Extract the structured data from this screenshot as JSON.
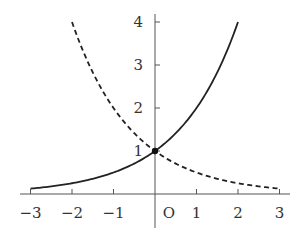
{
  "chart_data": {
    "type": "line",
    "title": "",
    "xlabel": "",
    "ylabel": "",
    "origin_label": "O",
    "x_ticks": [
      -3,
      -2,
      -1,
      1,
      2,
      3
    ],
    "x_tick_labels": [
      "−3",
      "−2",
      "−1",
      "1",
      "2",
      "3"
    ],
    "y_ticks": [
      1,
      2,
      3,
      4
    ],
    "y_tick_labels": [
      "1",
      "2",
      "3",
      "4"
    ],
    "xlim": [
      -3.3,
      3.3
    ],
    "ylim": [
      -0.5,
      4.2
    ],
    "grid": false,
    "legend": null,
    "series": [
      {
        "name": "y = 2^x",
        "style": "solid",
        "x": [
          -3,
          -2,
          -1,
          0,
          1,
          2
        ],
        "y": [
          0.125,
          0.25,
          0.5,
          1,
          2,
          4
        ]
      },
      {
        "name": "y = (1/2)^x",
        "style": "dashed",
        "x": [
          -2,
          -1,
          0,
          1,
          2,
          3
        ],
        "y": [
          4,
          2,
          1,
          0.5,
          0.25,
          0.125
        ]
      }
    ],
    "annotations": [
      {
        "type": "point",
        "x": 0,
        "y": 1,
        "note": "intersection"
      }
    ]
  }
}
